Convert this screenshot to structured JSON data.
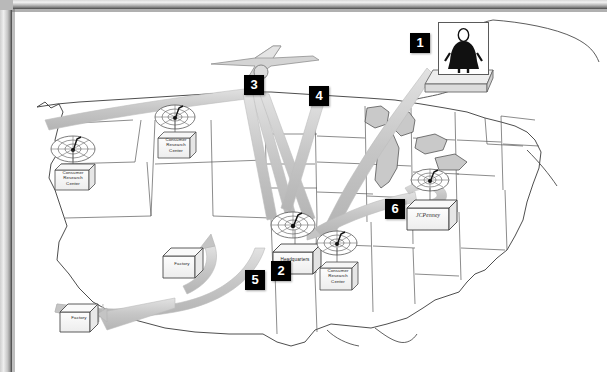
{
  "diagram": {
    "type": "annotated-map",
    "background_color": "#ffffff",
    "arrow_color": "#c9c9c9",
    "marker_color": "#000000",
    "marker_text_color": "#ffffff"
  },
  "markers": [
    {
      "id": "1",
      "label": "1",
      "x": 395,
      "y": 21,
      "describes": "customer-shopper-photo"
    },
    {
      "id": "2",
      "label": "2",
      "x": 256,
      "y": 249,
      "describes": "headquarters"
    },
    {
      "id": "3",
      "label": "3",
      "x": 229,
      "y": 63,
      "describes": "airplane-air-freight"
    },
    {
      "id": "4",
      "label": "4",
      "x": 294,
      "y": 74,
      "describes": "data-flow-to-headquarters"
    },
    {
      "id": "5",
      "label": "5",
      "x": 230,
      "y": 258,
      "describes": "shipment-to-factories"
    },
    {
      "id": "6",
      "label": "6",
      "x": 370,
      "y": 187,
      "describes": "store-replenishment-flow"
    }
  ],
  "facilities": [
    {
      "name": "Consumer Research Center",
      "type": "research-center",
      "x": 38,
      "y": 157,
      "icon": "satellite-dish-icon"
    },
    {
      "name": "Consumer Research Center",
      "type": "research-center",
      "x": 141,
      "y": 125,
      "icon": "satellite-dish-icon"
    },
    {
      "name": "Consumer Research Center",
      "type": "research-center",
      "x": 307,
      "y": 258,
      "icon": "satellite-dish-icon"
    },
    {
      "name": "Headquarters",
      "type": "headquarters",
      "x": 263,
      "y": 238,
      "icon": "satellite-dish-icon"
    },
    {
      "name": "Factory",
      "type": "factory",
      "x": 153,
      "y": 244,
      "icon": "box-icon"
    },
    {
      "name": "Factory",
      "type": "factory",
      "x": 52,
      "y": 300,
      "icon": "box-icon"
    },
    {
      "name": "JCPenney",
      "type": "retail-store",
      "x": 405,
      "y": 200,
      "icon": "store-icon"
    }
  ],
  "icons": {
    "person": "shopper-person-icon",
    "airplane": "airplane-icon",
    "satellite": "satellite-dish-icon",
    "factory": "factory-box-icon",
    "store": "store-box-icon"
  },
  "labels": {
    "research_center_line1": "Consumer",
    "research_center_line2": "Research",
    "research_center_line3": "Center",
    "headquarters": "Headquarters",
    "factory": "Factory",
    "store": "JCPenney"
  }
}
